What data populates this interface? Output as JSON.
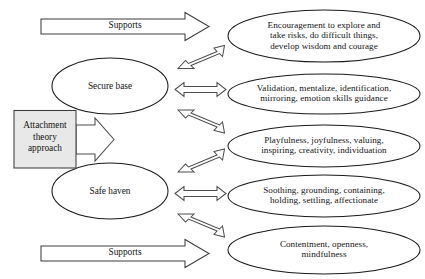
{
  "diagram": {
    "colors": {
      "background": "#ffffff",
      "box_fill": "#e8e8e8",
      "outline": "#1a1a1a",
      "arrow_outline": "#4d4d4d"
    },
    "source_box": {
      "label": "Attachment\ntheory\napproach",
      "name": "attachment-theory-approach-box"
    },
    "supports_arrows": [
      {
        "label": "Supports",
        "position": "top"
      },
      {
        "label": "Supports",
        "position": "bottom"
      }
    ],
    "left_nodes": [
      {
        "label": "Secure base",
        "name": "secure-base-ellipse"
      },
      {
        "label": "Safe haven",
        "name": "safe-haven-ellipse"
      }
    ],
    "right_nodes": [
      {
        "label": "Encouragement to explore and\ntake risks, do difficult things,\ndevelop wisdom and courage",
        "name": "encouragement-ellipse"
      },
      {
        "label": "Validation, mentalize, identification,\nmirroring, emotion skills guidance",
        "name": "validation-ellipse"
      },
      {
        "label": "Playfulness, joyfulness, valuing,\ninspiring, creativity, individuation",
        "name": "playfulness-ellipse"
      },
      {
        "label": "Soothing, grounding, containing,\nholding, settling, affectionate",
        "name": "soothing-ellipse"
      },
      {
        "label": "Contentment, openness,\nmindfulness",
        "name": "contentment-ellipse"
      }
    ],
    "connectors": [
      {
        "name": "secure-base-to-encouragement",
        "style": "double-headed-diagonal-up"
      },
      {
        "name": "secure-base-to-validation",
        "style": "double-headed-horizontal"
      },
      {
        "name": "secure-base-to-playfulness",
        "style": "double-headed-diagonal-down"
      },
      {
        "name": "safe-haven-to-playfulness",
        "style": "double-headed-diagonal-up"
      },
      {
        "name": "safe-haven-to-soothing",
        "style": "double-headed-horizontal"
      },
      {
        "name": "safe-haven-to-contentment",
        "style": "double-headed-diagonal-down"
      }
    ]
  }
}
